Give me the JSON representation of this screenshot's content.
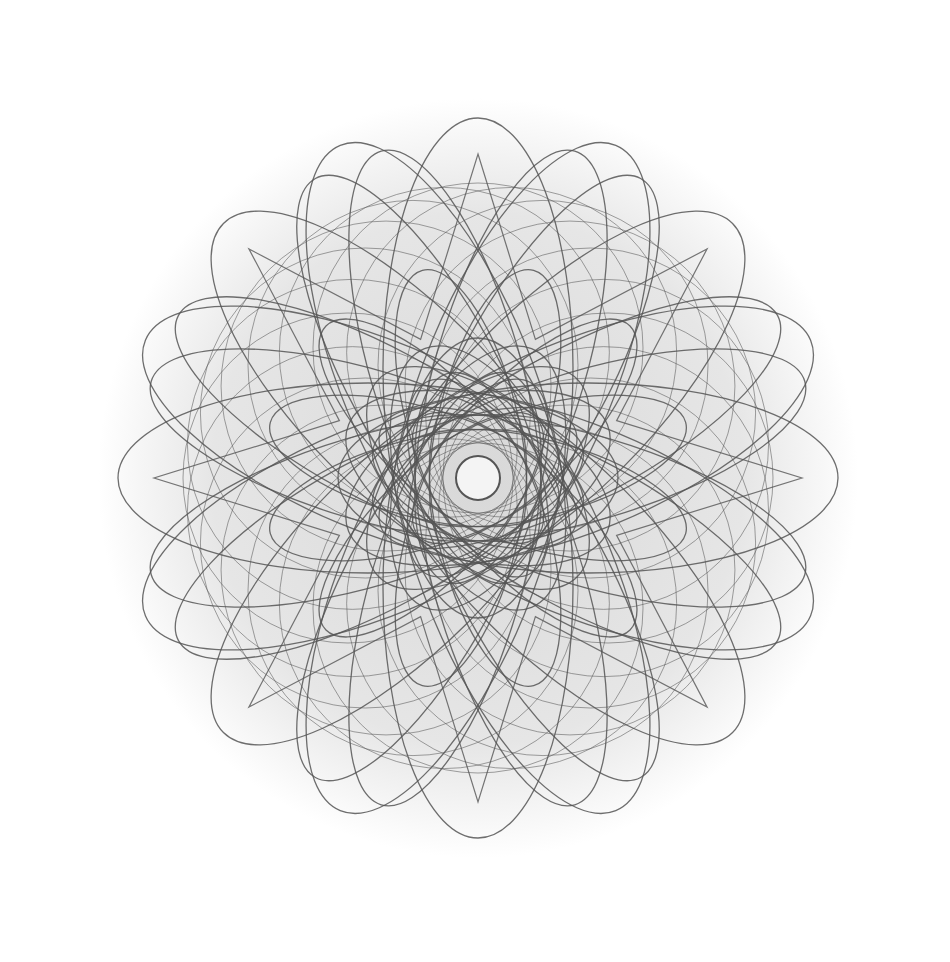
{
  "image": {
    "width": 950,
    "height": 962,
    "background": "#ffffff",
    "subject": "spirograph rosette line drawing",
    "center": [
      478,
      478
    ],
    "stroke_color": "#555555",
    "fill_haze": "#e6e6e6",
    "center_disc": {
      "r": 22,
      "color": "#f4f4f4"
    },
    "outer_ellipses": {
      "count": 8,
      "rx": 130,
      "ry": 75,
      "dist": 340,
      "pairs_offset_deg": 6
    },
    "mid_ellipses": {
      "count": 16,
      "rx": 160,
      "ry": 95,
      "dist": 200
    },
    "inner_loops": {
      "count": 12,
      "rx": 95,
      "ry": 55,
      "dist": 120
    },
    "star_points": {
      "count": 8,
      "r_outer": 360,
      "r_inner": 150
    },
    "circles": {
      "count": 24,
      "r": 300
    }
  }
}
